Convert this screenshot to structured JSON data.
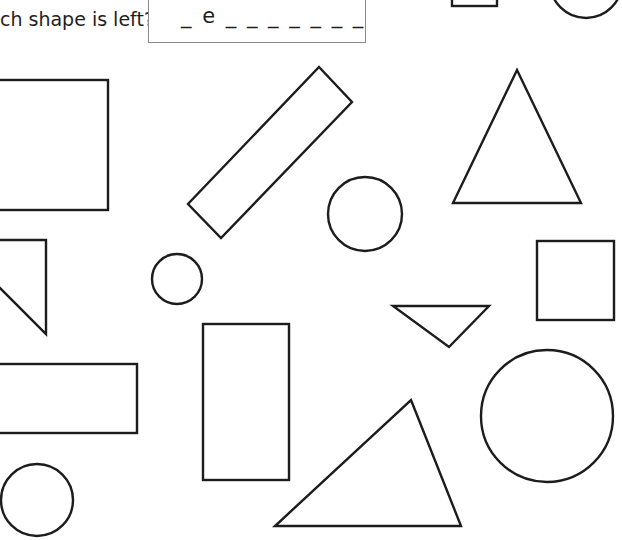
{
  "worksheet": {
    "question": "ch shape is left?",
    "answer_hint": "_ e _ _ _ _ _ _ _",
    "stroke_color": "#1c1c1c",
    "background": "#ffffff"
  },
  "shapes": [
    {
      "name": "partial-square-top",
      "type": "rectangle"
    },
    {
      "name": "partial-circle-top-right",
      "type": "circle"
    },
    {
      "name": "large-rectangle-left",
      "type": "rectangle"
    },
    {
      "name": "rotated-rectangle",
      "type": "rectangle"
    },
    {
      "name": "triangle-top-right",
      "type": "triangle"
    },
    {
      "name": "circle-center",
      "type": "circle"
    },
    {
      "name": "small-circle",
      "type": "circle"
    },
    {
      "name": "square-right",
      "type": "square"
    },
    {
      "name": "right-triangle-left",
      "type": "triangle"
    },
    {
      "name": "inverted-triangle",
      "type": "triangle"
    },
    {
      "name": "tall-rectangle",
      "type": "rectangle"
    },
    {
      "name": "wide-rectangle-left",
      "type": "rectangle"
    },
    {
      "name": "large-circle-right",
      "type": "circle"
    },
    {
      "name": "circle-bottom-left",
      "type": "circle"
    },
    {
      "name": "triangle-bottom",
      "type": "triangle"
    }
  ]
}
